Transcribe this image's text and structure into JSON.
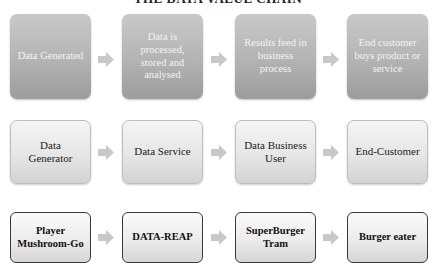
{
  "title": "THE DATA VALUE CHAIN",
  "rows": [
    {
      "name": "generic-value-chain",
      "boxes": [
        {
          "label": "Data Generated"
        },
        {
          "label": "Data is processed, stored and analysed"
        },
        {
          "label": "Results feed in business process"
        },
        {
          "label": "End customer buys product or service"
        }
      ]
    },
    {
      "name": "actor-roles",
      "boxes": [
        {
          "label": "Data Generator"
        },
        {
          "label": "Data Service"
        },
        {
          "label": "Data Business User"
        },
        {
          "label": "End-Customer"
        }
      ]
    },
    {
      "name": "example-instance",
      "boxes": [
        {
          "label": "Player Mushroom-Go"
        },
        {
          "label": "DATA-REAP"
        },
        {
          "label": "SuperBurger Tram"
        },
        {
          "label": "Burger eater"
        }
      ]
    }
  ],
  "icons": {
    "arrow": "arrow-right-icon"
  },
  "colors": {
    "row1_fill": "#b3b3b3",
    "row1_text": "#f4f4f4",
    "row2_fill": "#e6e6e6",
    "row3_border": "#3a3a3a",
    "arrow": "#c8c8c8"
  }
}
